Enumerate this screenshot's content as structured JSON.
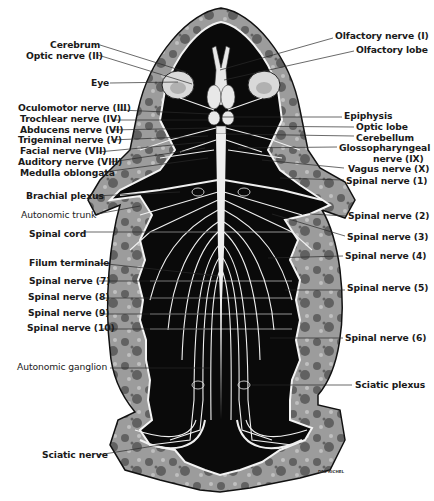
{
  "figure": {
    "colors": {
      "background": "#ffffff",
      "body_cavity": "#0a0a0a",
      "skin_tissue": "#9a9a9a",
      "skin_mottle": "#3a3a3a",
      "nerve": "#f2f2f2",
      "label_text": "#1a1a1a",
      "leader_line": "#2a2a2a"
    },
    "artist_signature": "DEL RICHEL",
    "labels_left": [
      {
        "text": "Cerebrum",
        "x": 50,
        "y": 40,
        "lx1": 100,
        "ly1": 45,
        "lx2": 186,
        "ly2": 72
      },
      {
        "text": "Optic nerve (II)",
        "x": 26,
        "y": 51,
        "lx1": 98,
        "ly1": 55,
        "lx2": 192,
        "ly2": 84
      },
      {
        "text": "Eye",
        "x": 91,
        "y": 78,
        "lx1": 110,
        "ly1": 83,
        "lx2": 178,
        "ly2": 82
      },
      {
        "text": "Oculomotor nerve (III)",
        "x": 18,
        "y": 103,
        "lx1": 120,
        "ly1": 110,
        "lx2": 210,
        "ly2": 114
      },
      {
        "text": "Trochlear nerve (IV)",
        "x": 20,
        "y": 114,
        "lx1": 113,
        "ly1": 120,
        "lx2": 208,
        "ly2": 120
      },
      {
        "text": "Abducens nerve (VI)",
        "x": 20,
        "y": 125,
        "lx1": 110,
        "ly1": 130,
        "lx2": 210,
        "ly2": 128
      },
      {
        "text": "Trigeminal nerve (V)",
        "x": 18,
        "y": 135,
        "lx1": 111,
        "ly1": 140,
        "lx2": 208,
        "ly2": 136
      },
      {
        "text": "Facial nerve (VII)",
        "x": 20,
        "y": 146,
        "lx1": 98,
        "ly1": 152,
        "lx2": 205,
        "ly2": 142
      },
      {
        "text": "Auditory nerve (VIII)",
        "x": 18,
        "y": 157,
        "lx1": 111,
        "ly1": 162,
        "lx2": 205,
        "ly2": 148
      },
      {
        "text": "Medulla oblongata",
        "x": 20,
        "y": 168,
        "lx1": 104,
        "ly1": 172,
        "lx2": 208,
        "ly2": 158
      },
      {
        "text": "Brachial plexus",
        "x": 26,
        "y": 191,
        "lx1": 94,
        "ly1": 196,
        "lx2": 180,
        "ly2": 192
      },
      {
        "text": "Autonomic trunk",
        "x": 21,
        "y": 210,
        "lx1": 97,
        "ly1": 214,
        "lx2": 140,
        "ly2": 206,
        "weight": "normal"
      },
      {
        "text": "Spinal cord",
        "x": 29,
        "y": 229,
        "lx1": 83,
        "ly1": 232,
        "lx2": 210,
        "ly2": 232
      },
      {
        "text": "Filum terminale",
        "x": 29,
        "y": 258,
        "lx1": 98,
        "ly1": 263,
        "lx2": 218,
        "ly2": 276
      },
      {
        "text": "Spinal nerve (7)",
        "x": 29,
        "y": 276,
        "lx1": 99,
        "ly1": 281,
        "lx2": 204,
        "ly2": 281
      },
      {
        "text": "Spinal nerve (8)",
        "x": 28,
        "y": 292,
        "lx1": 99,
        "ly1": 298,
        "lx2": 205,
        "ly2": 298
      },
      {
        "text": "Spinal nerve (9)",
        "x": 28,
        "y": 308,
        "lx1": 99,
        "ly1": 314,
        "lx2": 205,
        "ly2": 314
      },
      {
        "text": "Spinal nerve (10)",
        "x": 27,
        "y": 323,
        "lx1": 102,
        "ly1": 329,
        "lx2": 205,
        "ly2": 329
      },
      {
        "text": "Autonomic ganglion",
        "x": 17,
        "y": 362,
        "lx1": 110,
        "ly1": 368,
        "lx2": 210,
        "ly2": 368,
        "weight": "normal"
      },
      {
        "text": "Sciatic nerve",
        "x": 42,
        "y": 450,
        "lx1": 98,
        "ly1": 455,
        "lx2": 160,
        "ly2": 445
      }
    ],
    "labels_right": [
      {
        "text": "Olfactory nerve (I)",
        "x": 335,
        "y": 31,
        "lx1": 333,
        "ly1": 38,
        "lx2": 220,
        "ly2": 70
      },
      {
        "text": "Olfactory lobe",
        "x": 356,
        "y": 45,
        "lx1": 354,
        "ly1": 51,
        "lx2": 224,
        "ly2": 80
      },
      {
        "text": "Epiphysis",
        "x": 344,
        "y": 111,
        "lx1": 342,
        "ly1": 117,
        "lx2": 222,
        "ly2": 117
      },
      {
        "text": "Optic lobe",
        "x": 356,
        "y": 122,
        "lx1": 354,
        "ly1": 127,
        "lx2": 228,
        "ly2": 126
      },
      {
        "text": "Cerebellum",
        "x": 356,
        "y": 133,
        "lx1": 354,
        "ly1": 136,
        "lx2": 226,
        "ly2": 134
      },
      {
        "text": "Glossopharyngeal",
        "x": 339,
        "y": 143,
        "lx1": 337,
        "ly1": 147,
        "lx2": 238,
        "ly2": 148
      },
      {
        "text": "nerve (IX)",
        "x": 373,
        "y": 154,
        "lx1": 0,
        "ly1": 0,
        "lx2": 0,
        "ly2": 0
      },
      {
        "text": "Vagus nerve (X)",
        "x": 348,
        "y": 164,
        "lx1": 344,
        "ly1": 168,
        "lx2": 262,
        "ly2": 160
      },
      {
        "text": "Spinal nerve (1)",
        "x": 346,
        "y": 176,
        "lx1": 344,
        "ly1": 180,
        "lx2": 280,
        "ly2": 178
      },
      {
        "text": "Spinal nerve (2)",
        "x": 348,
        "y": 211,
        "lx1": 346,
        "ly1": 216,
        "lx2": 310,
        "ly2": 214
      },
      {
        "text": "Spinal nerve (3)",
        "x": 347,
        "y": 232,
        "lx1": 345,
        "ly1": 236,
        "lx2": 272,
        "ly2": 214
      },
      {
        "text": "Spinal nerve (4)",
        "x": 345,
        "y": 251,
        "lx1": 343,
        "ly1": 256,
        "lx2": 268,
        "ly2": 258
      },
      {
        "text": "Spinal nerve (5)",
        "x": 347,
        "y": 283,
        "lx1": 345,
        "ly1": 290,
        "lx2": 285,
        "ly2": 290
      },
      {
        "text": "Spinal nerve (6)",
        "x": 345,
        "y": 333,
        "lx1": 343,
        "ly1": 338,
        "lx2": 270,
        "ly2": 338
      },
      {
        "text": "Sciatic plexus",
        "x": 355,
        "y": 380,
        "lx1": 352,
        "ly1": 385,
        "lx2": 252,
        "ly2": 385
      }
    ]
  }
}
